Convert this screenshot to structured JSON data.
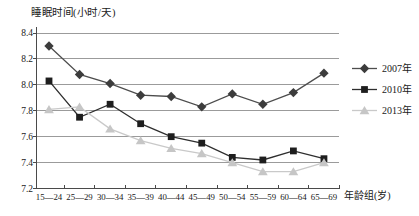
{
  "figure": {
    "background": "#ffffff"
  },
  "chart_data": {
    "type": "line",
    "title": "",
    "ylabel": "睡眠时间(小时/天)",
    "xlabel": "年龄组(岁)",
    "categories": [
      "15—24",
      "25—29",
      "30—34",
      "35—39",
      "40—44",
      "45—49",
      "50—54",
      "55—59",
      "60—64",
      "65—69"
    ],
    "ylim": [
      7.2,
      8.4
    ],
    "ytick_step": 0.2,
    "yticks": [
      8.4,
      8.2,
      8.0,
      7.8,
      7.6,
      7.4,
      7.2
    ],
    "ytick_labels": [
      "8.4",
      "8.2",
      "8.0",
      "7.8",
      "7.6",
      "7.4",
      "7.2"
    ],
    "grid": true,
    "legend_position": "right",
    "series": [
      {
        "name": "2007年",
        "marker": "diamond",
        "color": "#3c3c3c",
        "line_color": "#4d4d4d",
        "values": [
          8.3,
          8.08,
          8.01,
          7.92,
          7.91,
          7.83,
          7.93,
          7.85,
          7.94,
          8.09
        ]
      },
      {
        "name": "2010年",
        "marker": "square",
        "color": "#1e1e1e",
        "line_color": "#2e2e2e",
        "values": [
          8.03,
          7.75,
          7.85,
          7.7,
          7.6,
          7.55,
          7.44,
          7.42,
          7.49,
          7.43
        ]
      },
      {
        "name": "2013年",
        "marker": "triangle",
        "color": "#c6c6c6",
        "line_color": "#c9c9c9",
        "values": [
          7.81,
          7.83,
          7.66,
          7.57,
          7.51,
          7.47,
          7.4,
          7.33,
          7.33,
          7.4
        ]
      }
    ],
    "colors": {
      "gridline": "#9b9b9b",
      "axis": "#4a4a4a",
      "text": "#1a1a1a"
    }
  }
}
